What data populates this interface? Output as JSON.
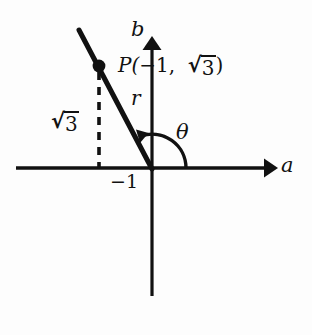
{
  "figure": {
    "kind": "math-diagram",
    "background_color": "#fdfdfd",
    "ink_color": "#111111"
  },
  "axes": {
    "horizontal_label": "a",
    "vertical_label": "b",
    "origin_label": ""
  },
  "labels": {
    "point_prefix": "P(",
    "point_x": "−1,",
    "point_radical": "√",
    "point_radicand": "3",
    "point_suffix": ")",
    "ray_label": "r",
    "angle_label": "θ",
    "x_intercept_tick": "−1",
    "height_radical": "√",
    "height_radicand": "3"
  },
  "geometry": {
    "origin": {
      "x": 152,
      "y": 168
    },
    "point_p": {
      "x": 99,
      "y": 66
    },
    "line_start": {
      "x": 79,
      "y": 30
    },
    "dashed_x": 99,
    "dashed_top": 72,
    "a_axis": {
      "x1": 16,
      "x2": 276,
      "y": 168
    },
    "b_axis": {
      "x": 152,
      "y_top": 36,
      "y_bottom": 296
    },
    "arc_radius": 34
  },
  "colors": {
    "stroke": "#111111",
    "background": "#fdfdfd"
  }
}
